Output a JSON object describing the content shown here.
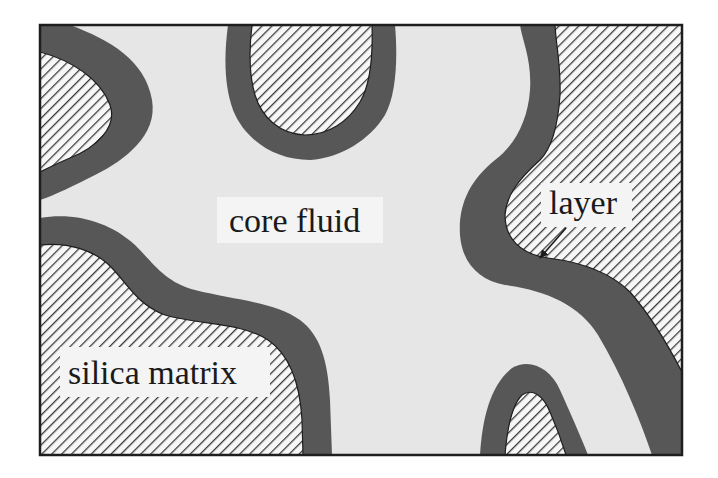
{
  "diagram": {
    "type": "schematic cross-section of porous medium",
    "frame": {
      "x": 40,
      "y": 25,
      "width": 642,
      "height": 430
    },
    "colors": {
      "background": "#ffffff",
      "core_fluid": "#e6e6e6",
      "layer": "#575757",
      "matrix_fill": "#f7f7f7",
      "hatch_line": "#3a3a3a",
      "frame": "#1e1e1e",
      "label_box": "#f4f4f4",
      "text": "#1a1a1a"
    },
    "regions": [
      {
        "id": "core-fluid",
        "label": "core fluid",
        "description": "light gray pore space filling the interior"
      },
      {
        "id": "layer",
        "label": "layer",
        "description": "dark gray band coating every matrix grain boundary"
      },
      {
        "id": "silica-matrix",
        "label": "silica matrix",
        "description": "diagonally hatched solid grains"
      }
    ],
    "labels": {
      "core_fluid": "core fluid",
      "layer": "layer",
      "silica_matrix": "silica matrix"
    },
    "annotations": [
      {
        "text": "layer",
        "arrow": {
          "from": [
            565,
            228
          ],
          "to": [
            538,
            262
          ]
        }
      }
    ]
  }
}
